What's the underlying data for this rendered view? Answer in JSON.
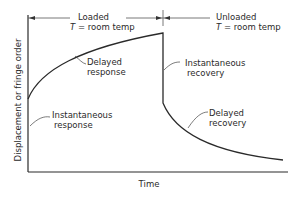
{
  "diagram": {
    "xlabel": "Time",
    "ylabel": "Displacement or fringe order",
    "phases": [
      {
        "name": "Loaded",
        "condition_var": "T",
        "condition_rest": " = room temp"
      },
      {
        "name": "Unloaded",
        "condition_var": "T",
        "condition_rest": " = room temp"
      }
    ],
    "annotations": {
      "instantaneous_response": [
        "Instantaneous",
        "response"
      ],
      "delayed_response": [
        "Delayed",
        "response"
      ],
      "instantaneous_recovery": [
        "Instantaneous",
        "recovery"
      ],
      "delayed_recovery": [
        "Delayed",
        "recovery"
      ]
    },
    "colors": {
      "line": "#2a2a2a",
      "guide": "#555555"
    }
  }
}
